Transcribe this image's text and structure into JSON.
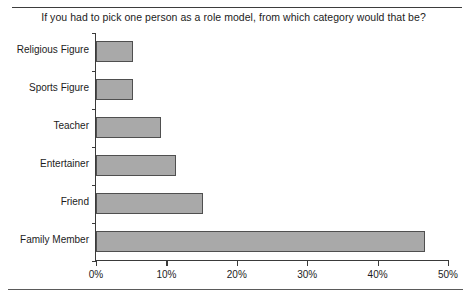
{
  "chart_data": {
    "type": "bar",
    "orientation": "horizontal",
    "title": "If you had to pick one person as a role model, from which category would that be?",
    "xlabel": "",
    "ylabel": "",
    "categories": [
      "Religious Figure",
      "Sports Figure",
      "Teacher",
      "Entertainer",
      "Friend",
      "Family Member"
    ],
    "values": [
      5.3,
      5.3,
      9.2,
      11.4,
      15.2,
      46.7
    ],
    "xlim": [
      0,
      50
    ],
    "xticks": [
      0,
      10,
      20,
      30,
      40,
      50
    ],
    "xtick_labels": [
      "0%",
      "10%",
      "20%",
      "30%",
      "40%",
      "50%"
    ],
    "grid": false,
    "legend": null,
    "bar_fill_color": "#a9a9a9",
    "bar_edge_color": "#4f4f4f",
    "axis_color": "#3a3a3a",
    "background_color": "#ffffff"
  }
}
